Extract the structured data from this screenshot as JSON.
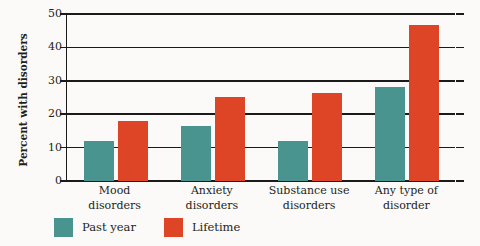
{
  "chart_data": {
    "type": "bar",
    "title": "",
    "xlabel": "",
    "ylabel": "Percent with disorders",
    "ylim": [
      0,
      50
    ],
    "ytick_labels": [
      "0",
      "10",
      "20",
      "30",
      "40",
      "50"
    ],
    "ytick_values": [
      0,
      10,
      20,
      30,
      40,
      50
    ],
    "grid": true,
    "legend_position": "bottom-left",
    "categories": [
      "Mood\ndisorders",
      "Anxiety\ndisorders",
      "Substance use\ndisorders",
      "Any type of\ndisorder"
    ],
    "category_lines": [
      [
        "Mood",
        "disorders"
      ],
      [
        "Anxiety",
        "disorders"
      ],
      [
        "Substance use",
        "disorders"
      ],
      [
        "Any type of",
        "disorder"
      ]
    ],
    "series": [
      {
        "name": "Past year",
        "color": "#4a9490",
        "values": [
          12.0,
          16.4,
          12.0,
          28.1
        ]
      },
      {
        "name": "Lifetime",
        "color": "#de4426",
        "values": [
          18.0,
          25.2,
          26.5,
          46.8
        ]
      }
    ]
  },
  "legend": {
    "items": [
      {
        "label": "Past year",
        "color": "#4a9490"
      },
      {
        "label": "Lifetime",
        "color": "#de4426"
      }
    ]
  }
}
